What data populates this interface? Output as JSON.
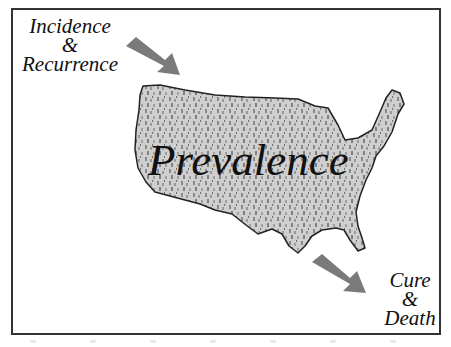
{
  "diagram": {
    "inflow_label": {
      "line1": "Incidence",
      "line2": "&",
      "line3": "Recurrence"
    },
    "center_label": "Prevalence",
    "outflow_label": {
      "line1": "Cure",
      "line2": "&",
      "line3": "Death"
    },
    "shape": "map-of-united-states",
    "colors": {
      "arrow": "#7a7a7a",
      "map_fill": "#b5b5b5",
      "map_outline": "#222222",
      "frame": "#333333"
    }
  }
}
